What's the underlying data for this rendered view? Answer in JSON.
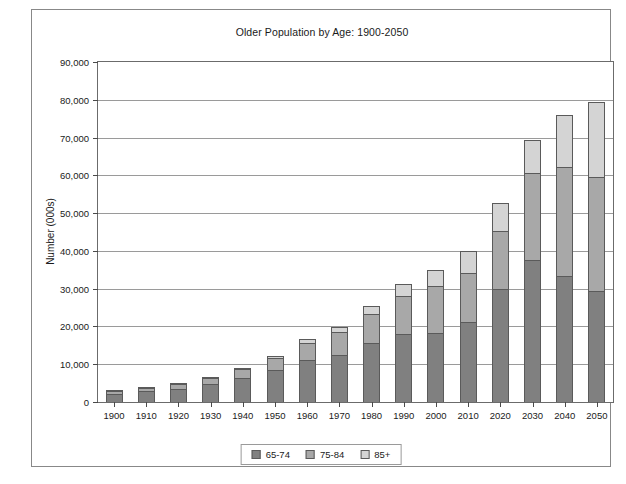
{
  "chart_data": {
    "type": "bar",
    "subtype": "stacked-column",
    "title": "Older Population by Age: 1900-2050",
    "xlabel": "",
    "ylabel": "Number (000s)",
    "ylim": [
      0,
      90000
    ],
    "ytick_step": 10000,
    "ytick_labels": [
      "0",
      "10,000",
      "20,000",
      "30,000",
      "40,000",
      "50,000",
      "60,000",
      "70,000",
      "80,000",
      "90,000"
    ],
    "ytick_values": [
      0,
      10000,
      20000,
      30000,
      40000,
      50000,
      60000,
      70000,
      80000,
      90000
    ],
    "grid": true,
    "grid_axis": "y",
    "legend_position": "bottom",
    "categories": [
      "1900",
      "1910",
      "1920",
      "1930",
      "1940",
      "1950",
      "1960",
      "1970",
      "1980",
      "1990",
      "2000",
      "2010",
      "2020",
      "2030",
      "2040",
      "2050"
    ],
    "series": [
      {
        "name": "65-74",
        "color": "#808080",
        "values": [
          2190,
          2790,
          3460,
          4720,
          6380,
          8410,
          10990,
          12440,
          15580,
          18040,
          18390,
          21060,
          30000,
          37500,
          33300,
          29500
        ]
      },
      {
        "name": "75-84",
        "color": "#a8a8a8",
        "values": [
          770,
          990,
          1260,
          1640,
          2280,
          3280,
          4630,
          6120,
          7730,
          10060,
          12360,
          13060,
          15400,
          23000,
          28800,
          30000
        ]
      },
      {
        "name": "85+",
        "color": "#d4d4d4",
        "values": [
          120,
          170,
          210,
          270,
          370,
          580,
          940,
          1410,
          2240,
          3030,
          4240,
          5750,
          7200,
          8800,
          13900,
          20000
        ]
      }
    ],
    "totals": [
      3080,
      3950,
      4930,
      6630,
      9030,
      12270,
      16560,
      19970,
      25550,
      31130,
      34990,
      39880,
      52600,
      69300,
      76000,
      79500
    ]
  },
  "legend": {
    "items": [
      {
        "label": "65-74",
        "color": "#808080"
      },
      {
        "label": "75-84",
        "color": "#a8a8a8"
      },
      {
        "label": "85+",
        "color": "#d4d4d4"
      }
    ]
  }
}
